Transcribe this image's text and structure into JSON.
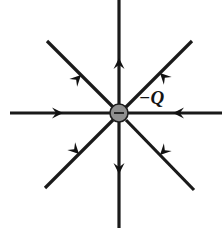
{
  "figure": {
    "type": "physics-field-diagram",
    "width": 222,
    "height": 229,
    "background_color": "#ffffff"
  },
  "charge": {
    "label": "−Q",
    "sign_glyph": "−",
    "polarity": "negative",
    "center_x": 119,
    "center_y": 113,
    "radius": 9,
    "fill_color": "#8f8f8f",
    "stroke_color": "#1c1c1c",
    "label_x": 139,
    "label_y": 104
  },
  "style": {
    "line_color": "#1a1a1a",
    "line_width": 3.2,
    "arrow_color": "#111111",
    "arrow_length": 11,
    "arrow_half_width": 5.5
  },
  "field_lines": [
    {
      "name": "field-line-west",
      "direction_label": "west",
      "angle_deg": 180,
      "x1": 10,
      "y1": 113,
      "x2": 110,
      "y2": 113,
      "arrow_x": 63,
      "arrow_y": 113,
      "arrow_angle_deg": 0,
      "flow": "inward"
    },
    {
      "name": "field-line-east",
      "direction_label": "east",
      "angle_deg": 0,
      "x1": 222,
      "y1": 113,
      "x2": 128,
      "y2": 113,
      "arrow_x": 173,
      "arrow_y": 113,
      "arrow_angle_deg": 180,
      "flow": "inward"
    },
    {
      "name": "field-line-north",
      "direction_label": "north",
      "angle_deg": 90,
      "x1": 119,
      "y1": 0,
      "x2": 119,
      "y2": 104,
      "arrow_x": 119,
      "arrow_y": 58,
      "arrow_angle_deg": 90,
      "flow": "inward"
    },
    {
      "name": "field-line-south",
      "direction_label": "south",
      "angle_deg": 270,
      "x1": 119,
      "y1": 228,
      "x2": 119,
      "y2": 122,
      "arrow_x": 119,
      "arrow_y": 174,
      "arrow_angle_deg": 270,
      "flow": "inward"
    },
    {
      "name": "field-line-northwest",
      "direction_label": "northwest",
      "angle_deg": 135,
      "x1": 47,
      "y1": 41,
      "x2": 113,
      "y2": 107,
      "arrow_x": 81,
      "arrow_y": 75,
      "arrow_angle_deg": 45,
      "flow": "inward"
    },
    {
      "name": "field-line-northeast",
      "direction_label": "northeast",
      "angle_deg": 45,
      "x1": 192,
      "y1": 41,
      "x2": 126,
      "y2": 107,
      "arrow_x": 160,
      "arrow_y": 73,
      "arrow_angle_deg": 135,
      "flow": "inward"
    },
    {
      "name": "field-line-southwest",
      "direction_label": "southwest",
      "angle_deg": 225,
      "x1": 45,
      "y1": 188,
      "x2": 113,
      "y2": 120,
      "arrow_x": 79,
      "arrow_y": 154,
      "arrow_angle_deg": 315,
      "flow": "inward"
    },
    {
      "name": "field-line-southeast",
      "direction_label": "southeast",
      "angle_deg": 315,
      "x1": 194,
      "y1": 190,
      "x2": 126,
      "y2": 120,
      "arrow_x": 160,
      "arrow_y": 155,
      "arrow_angle_deg": 225,
      "flow": "inward"
    }
  ]
}
